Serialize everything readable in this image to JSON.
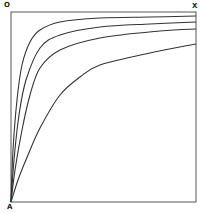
{
  "diagram": {
    "labels": {
      "top_left": "O",
      "top_right": "X",
      "bottom_left": "A"
    },
    "frame": {
      "left": 11,
      "top": 12,
      "right": 196,
      "bottom": 202,
      "stroke": "#555555"
    },
    "curves": [
      {
        "name": "curve-1",
        "points": [
          [
            11,
            202
          ],
          [
            13,
            150
          ],
          [
            17,
            100
          ],
          [
            22,
            65
          ],
          [
            30,
            42
          ],
          [
            40,
            30
          ],
          [
            60,
            22
          ],
          [
            100,
            18
          ],
          [
            150,
            17
          ],
          [
            196,
            16
          ]
        ]
      },
      {
        "name": "curve-2",
        "points": [
          [
            11,
            202
          ],
          [
            14,
            160
          ],
          [
            19,
            115
          ],
          [
            26,
            80
          ],
          [
            40,
            48
          ],
          [
            60,
            35
          ],
          [
            100,
            27
          ],
          [
            150,
            24
          ],
          [
            196,
            22
          ]
        ]
      },
      {
        "name": "curve-3",
        "points": [
          [
            11,
            202
          ],
          [
            15,
            170
          ],
          [
            22,
            130
          ],
          [
            30,
            95
          ],
          [
            40,
            68
          ],
          [
            60,
            50
          ],
          [
            100,
            38
          ],
          [
            160,
            31
          ],
          [
            196,
            29
          ]
        ]
      },
      {
        "name": "curve-4",
        "points": [
          [
            11,
            202
          ],
          [
            18,
            180
          ],
          [
            28,
            155
          ],
          [
            40,
            128
          ],
          [
            60,
            95
          ],
          [
            80,
            77
          ],
          [
            100,
            65
          ],
          [
            150,
            53
          ],
          [
            196,
            44
          ]
        ]
      }
    ],
    "curve_color": "#333333"
  }
}
